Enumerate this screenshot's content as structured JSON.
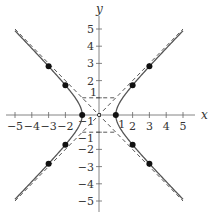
{
  "chart_data": {
    "type": "line",
    "title": "",
    "equation": "x^2 - y^2 = 1",
    "xlabel": "x",
    "ylabel": "y",
    "xlim": [
      -5,
      5
    ],
    "ylim": [
      -5,
      5
    ],
    "x_ticks": [
      -5,
      -4,
      -3,
      -2,
      -1,
      1,
      2,
      3,
      4,
      5
    ],
    "y_ticks": [
      -5,
      -4,
      -3,
      -2,
      -1,
      1,
      2,
      3,
      4,
      5
    ],
    "x_tick_labels": [
      "−5",
      "−4",
      "−3",
      "−2",
      "−1",
      "1",
      "2",
      "3",
      "4",
      "5"
    ],
    "y_tick_labels": [
      "−5",
      "−4",
      "−3",
      "−2",
      "−1",
      "1",
      "2",
      "3",
      "4",
      "5"
    ],
    "grid": false,
    "legend": null,
    "series": [
      {
        "name": "hyperbola right branch",
        "style": "solid",
        "function": "x = sqrt(1 + y^2)",
        "y_range": [
          -4.9,
          4.9
        ]
      },
      {
        "name": "hyperbola left branch",
        "style": "solid",
        "function": "x = -sqrt(1 + y^2)",
        "y_range": [
          -4.9,
          4.9
        ]
      },
      {
        "name": "asymptote y = x",
        "style": "dashed",
        "x": [
          -5,
          5
        ],
        "y": [
          -5,
          5
        ]
      },
      {
        "name": "asymptote y = -x",
        "style": "dashed",
        "x": [
          -5,
          5
        ],
        "y": [
          5,
          -5
        ]
      },
      {
        "name": "box top",
        "style": "dashed",
        "x": [
          -1,
          1
        ],
        "y": [
          1,
          1
        ]
      },
      {
        "name": "box bottom",
        "style": "dashed",
        "x": [
          -1,
          1
        ],
        "y": [
          -1,
          -1
        ]
      }
    ],
    "points": [
      {
        "x": -3,
        "y": 2.83
      },
      {
        "x": -2,
        "y": 1.73
      },
      {
        "x": -1,
        "y": 0
      },
      {
        "x": -2,
        "y": -1.73
      },
      {
        "x": -3,
        "y": -2.83
      },
      {
        "x": 3,
        "y": 2.83
      },
      {
        "x": 2,
        "y": 1.73
      },
      {
        "x": 1,
        "y": 0
      },
      {
        "x": 2,
        "y": -1.73
      },
      {
        "x": 3,
        "y": -2.83
      }
    ],
    "origin_marker": {
      "x": 0,
      "y": 0
    }
  },
  "layout": {
    "origin_px": [
      99,
      115
    ],
    "scale_x": 16.8,
    "scale_y": 17.2,
    "colors": {
      "curve": "#555555",
      "axis": "#666666",
      "dash": "#444444",
      "point": "#111111"
    }
  }
}
